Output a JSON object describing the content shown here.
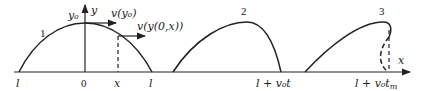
{
  "diagram": {
    "axis": {
      "x_label": "x",
      "y_label": "y"
    },
    "ticks": [
      {
        "id": "left-l",
        "label": "l"
      },
      {
        "id": "origin",
        "label": "0"
      },
      {
        "id": "x-pos",
        "label": "x"
      },
      {
        "id": "right-l",
        "label": "l"
      },
      {
        "id": "shift-t",
        "label": "l + v₀t"
      },
      {
        "id": "shift-tm",
        "label": "l + v₀t",
        "subscript": "m"
      }
    ],
    "annotations": {
      "peak_label": "y₀",
      "velocity_peak": "v(y₀)",
      "velocity_x": "v(y(0,x))"
    },
    "curves": [
      {
        "label": "1",
        "description": "initial symmetric profile"
      },
      {
        "label": "2",
        "description": "steepened profile at time t"
      },
      {
        "label": "3",
        "description": "overturned profile at time t_m"
      }
    ],
    "colors": {
      "stroke": "#222222",
      "background": "#ffffff"
    }
  }
}
